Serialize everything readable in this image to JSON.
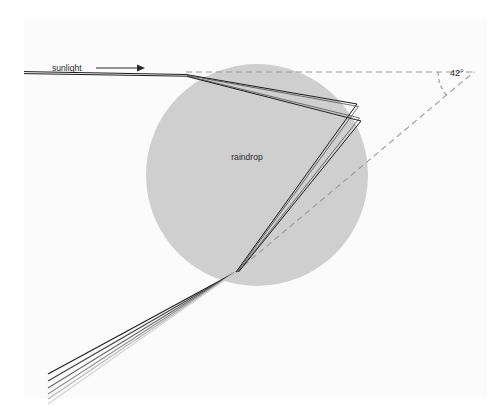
{
  "figure": {
    "title_alt": "Refraction and dispersion of sunlight in a spherical raindrop",
    "background_color": "#ffffff",
    "panel": {
      "fill": "#fbfbfb",
      "x": 24,
      "y": 18,
      "width": 463,
      "height": 380
    }
  },
  "labels": {
    "sunlight": "sunlight",
    "raindrop": "raindrop",
    "angle": "42°"
  },
  "raindrop": {
    "label": "raindrop",
    "fill_color": "#cfcfcf",
    "center_x": 257,
    "center_y": 175,
    "radius": 111,
    "label_x": 247,
    "label_y": 160
  },
  "sunlight_arrow": {
    "label": "sunlight",
    "label_x": 52,
    "label_y": 71,
    "line_color": "#2a2a2a",
    "line_start_x": 96,
    "line_end_x": 143,
    "line_y": 68,
    "arrow_head_x": 143
  },
  "angle_annotation": {
    "value": "42°",
    "degrees": 42,
    "label_x": 456,
    "label_y": 76,
    "dash_color": "#9a9a9a",
    "vertex_x": 474,
    "vertex_y": 72,
    "horizontal_ray_start_x": 186,
    "horizontal_ray_y": 72,
    "arc_radius": 36
  },
  "geometry": {
    "entry_point": {
      "x": 186,
      "y": 75
    },
    "back_reflection_points": [
      {
        "x": 357,
        "y": 104
      },
      {
        "x": 361,
        "y": 121
      }
    ],
    "exit_point": {
      "x": 236,
      "y": 272
    },
    "dashed_exit_ray_end": {
      "x": 497,
      "y": 60
    }
  },
  "spectrum_rays": {
    "description": "Dispersed exit rays fanning out below-left from the raindrop",
    "count": 6,
    "colors": [
      "#1c1c1c",
      "#3d3d3d",
      "#666666",
      "#8f8f8f",
      "#b5b5b5",
      "#d2d2d2"
    ],
    "fan_origin": {
      "x": 236,
      "y": 272
    },
    "end_x": 48,
    "end_y_values": [
      374,
      381,
      388,
      394,
      399,
      404
    ]
  },
  "ray_paths": {
    "stroke_color": "#1c1c1c",
    "inner_rays": [
      {
        "name": "ray-upper",
        "points": [
          [
            186,
            75
          ],
          [
            357,
            104
          ],
          [
            236,
            272
          ]
        ]
      },
      {
        "name": "ray-lower",
        "points": [
          [
            186,
            76
          ],
          [
            361,
            121
          ],
          [
            238,
            272
          ]
        ]
      }
    ],
    "incident_rays": [
      {
        "name": "incident-upper",
        "from": [
          24,
          72
        ],
        "to": [
          186,
          75
        ]
      },
      {
        "name": "incident-lower",
        "from": [
          24,
          74
        ],
        "to": [
          186,
          76
        ]
      }
    ]
  }
}
